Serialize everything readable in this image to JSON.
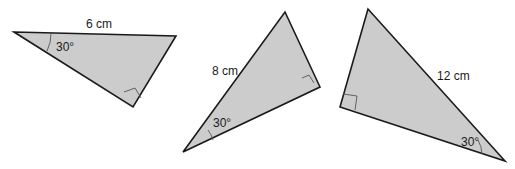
{
  "colors": {
    "fill": "#cccccc",
    "stroke": "#1a1a1a",
    "mark": "#555555",
    "background": "#ffffff"
  },
  "triangles": [
    {
      "id": "triangle-1",
      "side_label": "6 cm",
      "angle_label": "30°",
      "right_angle": true,
      "labeled_side": "hypotenuse-adjacent (top side)"
    },
    {
      "id": "triangle-2",
      "side_label": "8 cm",
      "angle_label": "30°",
      "right_angle": true,
      "labeled_side": "hypotenuse"
    },
    {
      "id": "triangle-3",
      "side_label": "12 cm",
      "angle_label": "30°",
      "right_angle": true,
      "labeled_side": "hypotenuse"
    }
  ]
}
